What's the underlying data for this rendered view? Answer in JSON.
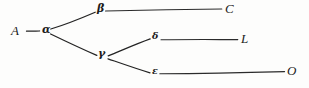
{
  "figure": {
    "kind": "hand-drawn-tree-diagram",
    "background_color": "#fdfdfc",
    "ink_color": "#232323",
    "width_px": 309,
    "height_px": 88
  },
  "nodes": {
    "a_root": {
      "label": "A",
      "script": "latin",
      "x": 11,
      "y": 24
    },
    "alpha": {
      "label": "α",
      "script": "greek",
      "x": 42,
      "y": 29
    },
    "beta": {
      "label": "β",
      "script": "greek",
      "x": 97,
      "y": 5
    },
    "gamma": {
      "label": "γ",
      "script": "greek",
      "x": 97,
      "y": 50
    },
    "delta": {
      "label": "δ",
      "script": "greek",
      "x": 152,
      "y": 33
    },
    "epsilon": {
      "label": "ε",
      "script": "greek",
      "x": 152,
      "y": 68
    },
    "c_leaf": {
      "label": "C",
      "script": "latin",
      "x": 225,
      "y": 4
    },
    "l_leaf": {
      "label": "L",
      "script": "latin",
      "x": 241,
      "y": 33
    },
    "o_leaf": {
      "label": "O",
      "script": "latin",
      "x": 287,
      "y": 66
    }
  },
  "edges": [
    {
      "name": "edge-A-alpha",
      "from": "A",
      "to": "α",
      "x1": 26,
      "y1": 31,
      "x2": 40,
      "y2": 31
    },
    {
      "name": "edge-alpha-beta",
      "from": "α",
      "to": "β",
      "x1": 51,
      "y1": 29,
      "x2": 95,
      "y2": 12
    },
    {
      "name": "edge-alpha-gamma",
      "from": "α",
      "to": "γ",
      "x1": 51,
      "y1": 34,
      "x2": 97,
      "y2": 55
    },
    {
      "name": "edge-beta-C",
      "from": "β",
      "to": "C",
      "x1": 106,
      "y1": 11,
      "x2": 222,
      "y2": 9
    },
    {
      "name": "edge-gamma-delta",
      "from": "γ",
      "to": "δ",
      "x1": 108,
      "y1": 56,
      "x2": 150,
      "y2": 39
    },
    {
      "name": "edge-gamma-epsilon",
      "from": "γ",
      "to": "ε",
      "x1": 108,
      "y1": 59,
      "x2": 150,
      "y2": 73
    },
    {
      "name": "edge-delta-L",
      "from": "δ",
      "to": "L",
      "x1": 161,
      "y1": 40,
      "x2": 238,
      "y2": 40
    },
    {
      "name": "edge-epsilon-O",
      "from": "ε",
      "to": "O",
      "x1": 160,
      "y1": 74,
      "x2": 285,
      "y2": 72
    }
  ],
  "structure": {
    "root": "A",
    "description": "A → α; α → β, γ; β → C; γ → δ, ε; δ → L; ε → O",
    "leaves": [
      "C",
      "L",
      "O"
    ],
    "internal_nodes": [
      "A",
      "α",
      "β",
      "γ",
      "δ",
      "ε"
    ]
  }
}
